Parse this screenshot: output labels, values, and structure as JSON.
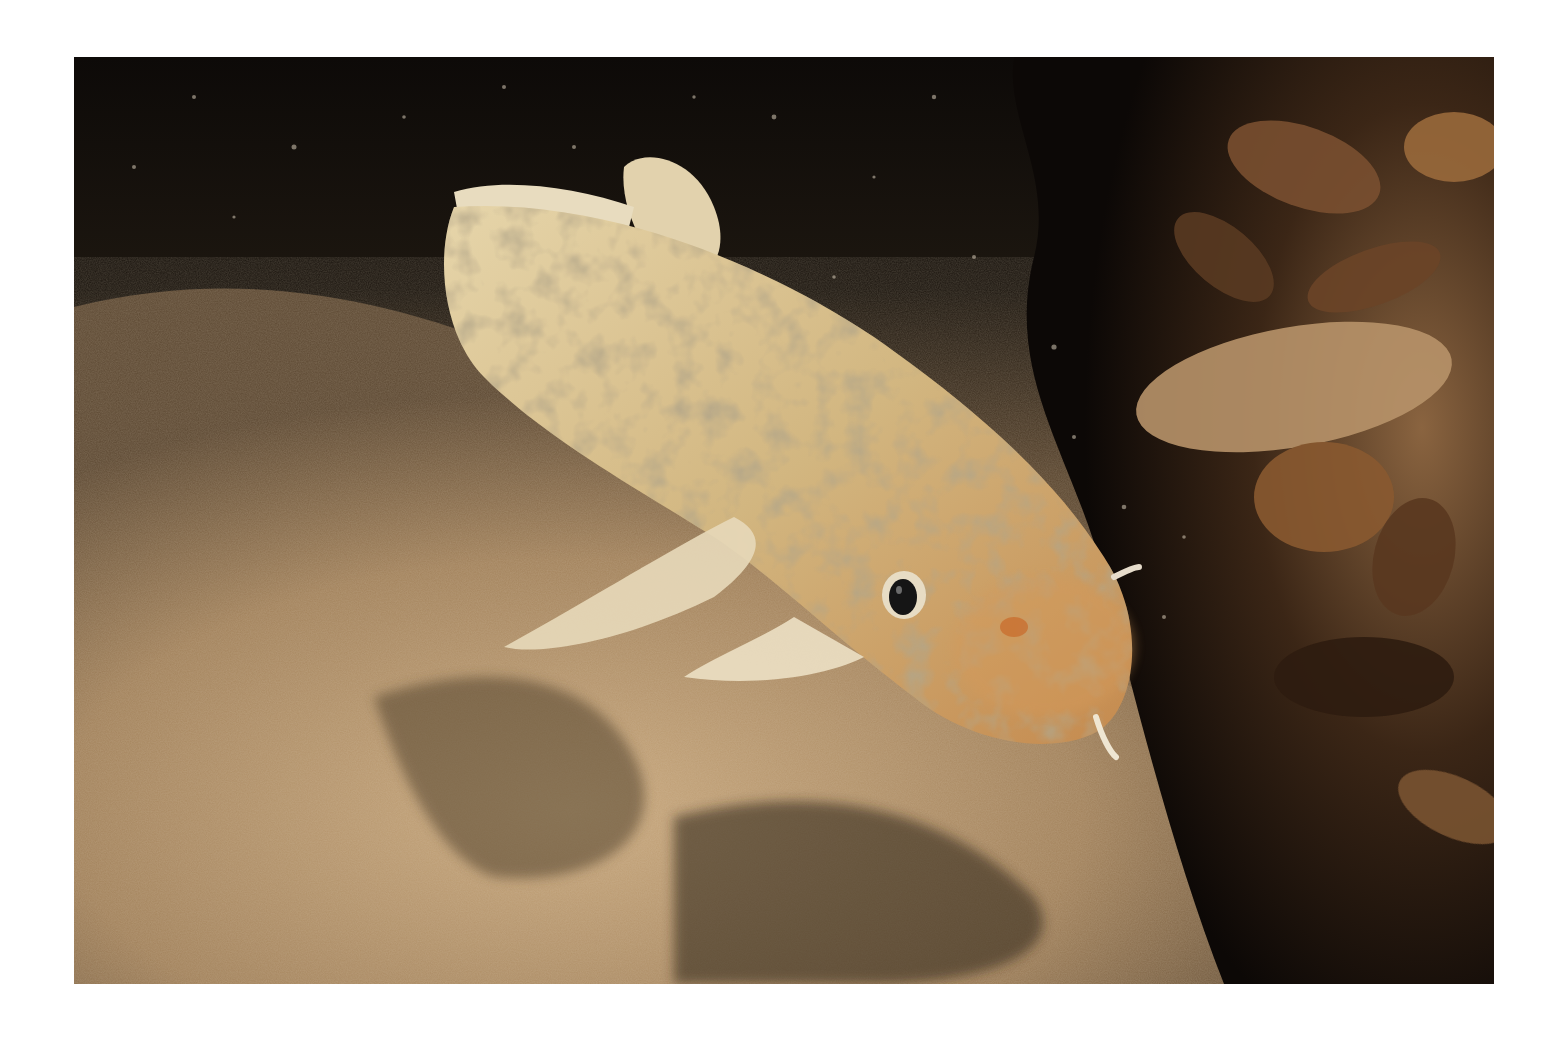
{
  "photo": {
    "subject": "burbot fish resting on sandy lake bottom beside zebra-mussel encrusted rock",
    "colors": {
      "background": "#ffffff",
      "water_dark": "#0e0b08",
      "sand_light": "#c8a87e",
      "sand_mid": "#a88660",
      "fish_body": "#d9c08e",
      "fish_mottle": "#8f7a55",
      "fish_head": "#d49a5a",
      "mussel_dark": "#3a2414",
      "mussel_light": "#9a6a3c",
      "eye": "#151515"
    }
  }
}
